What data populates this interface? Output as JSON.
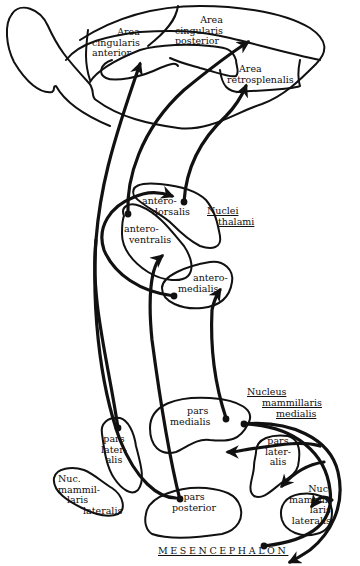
{
  "figure": {
    "type": "anatomical pathway diagram"
  },
  "cortex": {
    "area_cingularis_anterior": [
      "Area",
      "cingularis",
      "anterior"
    ],
    "area_cingularis_posterior": [
      "Area",
      "cingularis",
      "posterior"
    ],
    "area_retrosplenalis": [
      "Area",
      "retrosplenalis"
    ]
  },
  "thalamus": {
    "group_title": [
      "Nuclei",
      "thalami"
    ],
    "anterodorsalis": [
      "antero-",
      "dorsalis"
    ],
    "anteroventralis": [
      "antero-",
      "ventralis"
    ],
    "anteromedialis": [
      "antero-",
      "medialis"
    ]
  },
  "mammillary": {
    "medial_title": [
      "Nucleus",
      "mammillaris",
      "medialis"
    ],
    "pars_medialis": [
      "pars",
      "medialis"
    ],
    "pars_lateralis_right": [
      "pars",
      "later-",
      "alis"
    ],
    "pars_lateralis_left": [
      "pars",
      "later-",
      "alis"
    ],
    "pars_posterior": [
      "pars",
      "posterior"
    ],
    "nuc_lateralis_left": [
      "Nuc.",
      "mammil-",
      "laris",
      "lateralis"
    ],
    "nuc_lateralis_right": [
      "Nuc.",
      "mammil-",
      "laris",
      "lateralis"
    ]
  },
  "region": {
    "mesencephalon": "MESENCEPHALON"
  },
  "colors": {
    "ink": "#111111",
    "background": "#ffffff"
  }
}
